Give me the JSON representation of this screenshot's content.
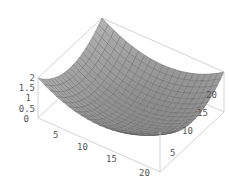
{
  "chart_data": {
    "type": "surface3d",
    "title": "",
    "function_description": "paraboloid bowl, z = ((x-x0)^2 + (y-y0)^2) scaled so corners reach ~2 and minimum ~0",
    "x": {
      "label": "",
      "ticks": [
        5,
        10,
        15,
        20
      ],
      "range": [
        0,
        21
      ]
    },
    "y": {
      "label": "",
      "ticks": [
        5,
        10,
        15,
        20
      ],
      "range": [
        0,
        21
      ]
    },
    "z": {
      "label": "",
      "ticks": [
        0,
        0.5,
        1,
        1.5,
        2
      ],
      "range": [
        0,
        2
      ]
    },
    "grid_size": 21,
    "mesh": true,
    "boxed": true
  },
  "style": {
    "surface_color": "#9a9a9a",
    "mesh_color": "#5a5a5a",
    "box_color": "#c8c8c8",
    "tick_label_color": "#555555"
  },
  "labels": {
    "z_ticks": [
      "0",
      "0.5",
      "1",
      "1.5",
      "2"
    ],
    "x_ticks": [
      "5",
      "10",
      "15",
      "20"
    ],
    "y_ticks": [
      "5",
      "10",
      "15",
      "20"
    ]
  }
}
